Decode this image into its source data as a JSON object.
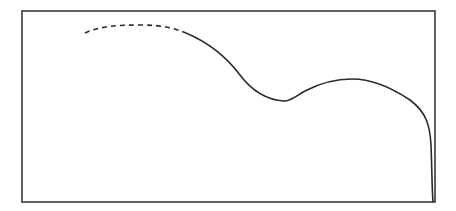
{
  "figure": {
    "frame": {
      "x": 22,
      "y": 11,
      "width": 413,
      "height": 191,
      "stroke": "#3a3a3a",
      "stroke_width": 1.6
    },
    "curve": {
      "color": "#2a2a2a",
      "stroke_width": 1.6,
      "dashed_segment": {
        "dasharray": "5,4",
        "path": "M 85 33 C 100 26, 118 25, 140 25 C 158 25, 172 27, 186 33"
      },
      "solid_segment": {
        "path": "M 186 33 C 205 41, 225 55, 240 75 C 252 91, 268 100, 284 101 C 292 101, 297 95, 305 91 C 322 82, 338 79, 352 79 C 372 79, 392 88, 410 100 C 426 112, 430 125, 431 145 C 432 170, 432 190, 433 202"
      }
    }
  }
}
